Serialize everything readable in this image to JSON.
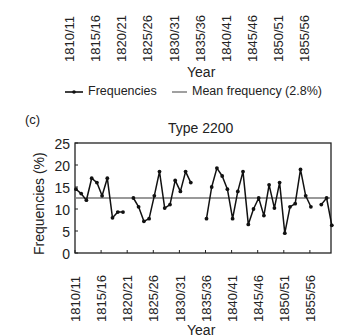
{
  "top_panel_remnant": {
    "x_tick_labels": [
      "1810/11",
      "1815/16",
      "1820/21",
      "1825/26",
      "1830/31",
      "1835/36",
      "1840/41",
      "1845/46",
      "1850/51",
      "1855/56"
    ],
    "x_axis_label": "Year",
    "legend": {
      "series_label": "Frequencies",
      "mean_label": "Mean frequency (2.8%)"
    }
  },
  "panel": {
    "label": "(c)",
    "title": "Type 2200"
  },
  "chart_data": {
    "type": "line",
    "title": "Type 2200",
    "panel_label": "(c)",
    "xlabel": "Year",
    "ylabel": "Frequencies (%)",
    "ylim": [
      0,
      25
    ],
    "yticks": [
      0,
      5,
      10,
      15,
      20,
      25
    ],
    "xticks": [
      "1810/11",
      "1815/16",
      "1820/21",
      "1825/26",
      "1830/31",
      "1835/36",
      "1840/41",
      "1845/46",
      "1850/51",
      "1855/56"
    ],
    "grid": false,
    "legend_position": "above plot (shared with panel above)",
    "legend": [
      "Frequencies",
      "Mean frequency (2.8%)"
    ],
    "mean_line_value": 12.5,
    "series": [
      {
        "name": "Frequencies",
        "x_year_start": [
          1810,
          1811,
          1812,
          1813,
          1814,
          1815,
          1816,
          1817,
          1818,
          1819,
          1820,
          1821,
          1822,
          1823,
          1824,
          1825,
          1826,
          1827,
          1828,
          1829,
          1830,
          1831,
          1832,
          1833,
          1834,
          1835,
          1836,
          1837,
          1838,
          1839,
          1840,
          1841,
          1842,
          1843,
          1844,
          1845,
          1846,
          1847,
          1848,
          1849,
          1850,
          1851,
          1852,
          1853,
          1854,
          1855,
          1856,
          1857,
          1858,
          1859
        ],
        "values": [
          14.5,
          13.5,
          12.0,
          17.0,
          16.0,
          13.0,
          17.0,
          8.0,
          9.3,
          9.3,
          null,
          12.5,
          10.5,
          7.2,
          7.8,
          13.0,
          18.5,
          10.2,
          11.0,
          16.5,
          14.0,
          18.5,
          16.0,
          null,
          null,
          7.8,
          15.0,
          19.3,
          17.5,
          14.5,
          7.8,
          14.0,
          18.5,
          6.5,
          10.0,
          12.5,
          8.5,
          15.5,
          10.2,
          16.0,
          4.5,
          10.5,
          11.2,
          19.0,
          13.0,
          10.5,
          null,
          11.0,
          12.5,
          6.3
        ]
      }
    ]
  }
}
